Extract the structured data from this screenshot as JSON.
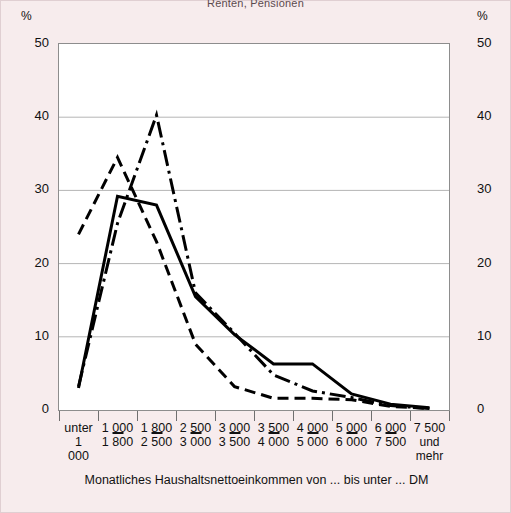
{
  "figure": {
    "title_partial": "Renten, Pensionen",
    "unit_label": "%",
    "axis_title": "Monatliches Haushaltsnettoeinkommen von ... bis unter ... DM",
    "background_color": "#f7eced",
    "plot_background": "#ffffff",
    "line_color": "#000000",
    "grid_color": "#b5b5b5"
  },
  "chart_data": {
    "type": "line",
    "title": "Renten, Pensionen",
    "xlabel": "Monatliches Haushaltsnettoeinkommen von ... bis unter ... DM",
    "ylabel": "%",
    "ylim": [
      0,
      50
    ],
    "yticks": [
      0,
      10,
      20,
      30,
      40,
      50
    ],
    "grid": true,
    "legend_position": "none",
    "categories": [
      "unter 1 000",
      "1 000 - 1 800",
      "1 800 - 2 500",
      "2 500 - 3 000",
      "3 000 - 3 500",
      "3 500 - 4 000",
      "4 000 - 5 000",
      "5 000 - 6 000",
      "6 000 - 7 500",
      "7 500 und mehr"
    ],
    "category_lines": [
      {
        "top": "unter",
        "bottom": "1 000"
      },
      {
        "top": "1 000",
        "bottom": "1 800"
      },
      {
        "top": "1 800",
        "bottom": "2 500"
      },
      {
        "top": "2 500",
        "bottom": "3 000"
      },
      {
        "top": "3 000",
        "bottom": "3 500"
      },
      {
        "top": "3 500",
        "bottom": "4 000"
      },
      {
        "top": "4 000",
        "bottom": "5 000"
      },
      {
        "top": "5 000",
        "bottom": "6 000"
      },
      {
        "top": "6 000",
        "bottom": "7 500"
      },
      {
        "top": "7 500",
        "bottom": "und mehr"
      }
    ],
    "series": [
      {
        "name": "Serie 1",
        "style": "solid",
        "values": [
          3.0,
          29.2,
          28.0,
          15.5,
          10.3,
          6.3,
          6.3,
          2.2,
          0.8,
          0.3
        ]
      },
      {
        "name": "Serie 2",
        "style": "dashed",
        "values": [
          24.0,
          34.5,
          23.0,
          9.0,
          3.2,
          1.6,
          1.6,
          1.4,
          0.5,
          0.2
        ]
      },
      {
        "name": "Serie 3",
        "style": "dashdot",
        "values": [
          3.2,
          25.5,
          40.3,
          16.0,
          10.5,
          4.8,
          2.6,
          1.7,
          0.6,
          0.2
        ]
      }
    ]
  },
  "axes": {
    "left_ticks": [
      "50",
      "40",
      "30",
      "20",
      "10",
      "0"
    ],
    "right_ticks": [
      "50",
      "40",
      "30",
      "20",
      "10",
      "0"
    ],
    "left_unit": "%",
    "right_unit": "%"
  }
}
